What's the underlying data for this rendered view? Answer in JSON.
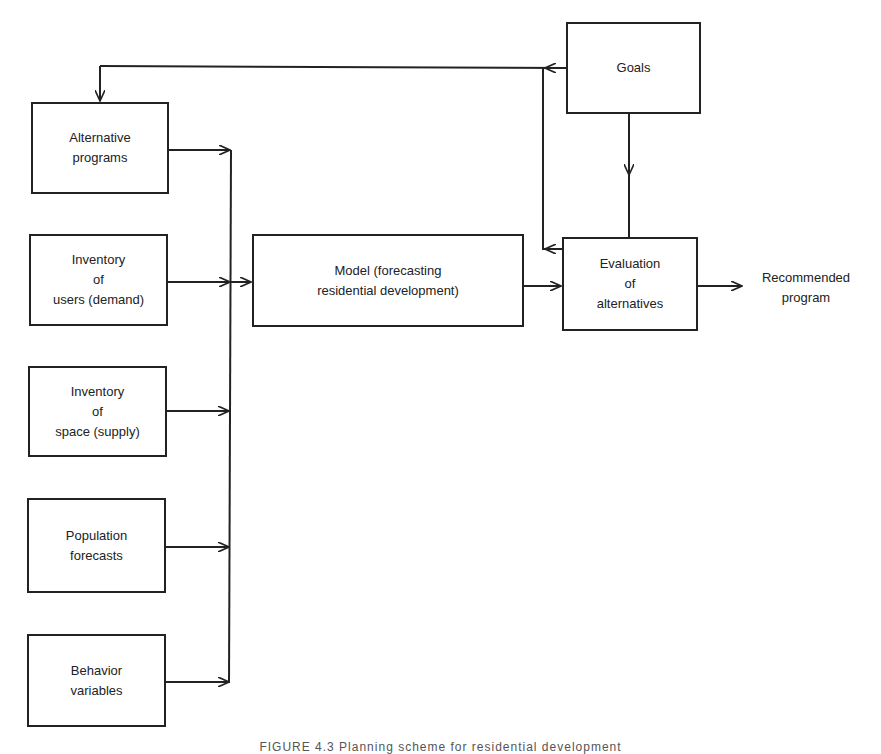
{
  "diagram": {
    "inputs": [
      {
        "label": "Alternative\nprograms"
      },
      {
        "label": "Inventory\nof\nusers (demand)"
      },
      {
        "label": "Inventory\nof\nspace (supply)"
      },
      {
        "label": "Population\nforecasts"
      },
      {
        "label": "Behavior\nvariables"
      }
    ],
    "model": {
      "label": "Model (forecasting\nresidential development)"
    },
    "goals": {
      "label": "Goals"
    },
    "evaluation": {
      "label": "Evaluation\nof\nalternatives"
    },
    "output": {
      "label": "Recommended\nprogram"
    },
    "caption": "FIGURE 4.3   Planning scheme for residential development"
  },
  "colors": {
    "line": "#222222",
    "background": "#ffffff"
  }
}
